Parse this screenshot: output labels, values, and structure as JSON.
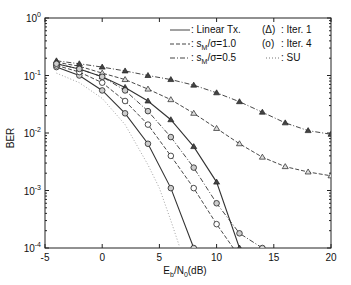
{
  "chart_data": {
    "type": "line",
    "title": "",
    "xlabel": "E_b/N_0(dB)",
    "ylabel": "BER",
    "xlim": [
      -5,
      20
    ],
    "ylim": [
      0.0001,
      1
    ],
    "yscale": "log",
    "xticks": [
      "-5",
      "0",
      "5",
      "10",
      "15",
      "20"
    ],
    "yticks": [
      "10^0",
      "10^-1",
      "10^-2",
      "10^-3",
      "10^-4"
    ],
    "grid": false,
    "legend": {
      "placement": "top-right",
      "left": [
        {
          "line": "solid",
          "label": ": Linear Tx."
        },
        {
          "line": "dashed",
          "label": ": s_M/σ=1.0"
        },
        {
          "line": "dashdot",
          "label": ": s_M/σ=0.5"
        }
      ],
      "right": [
        {
          "marker": "(Δ)",
          "label": ": Iter. 1"
        },
        {
          "marker": "(o)",
          "label": ": Iter. 4"
        },
        {
          "line": "dotted",
          "label": ": SU"
        }
      ]
    },
    "series": [
      {
        "name": "Linear Tx. Iter. 1",
        "line": "solid",
        "marker": "triangle",
        "x": [
          -4,
          -2,
          0,
          2,
          4,
          6,
          8,
          10,
          12
        ],
        "y": [
          0.16,
          0.13,
          0.095,
          0.062,
          0.036,
          0.017,
          0.0058,
          0.0014,
          0.0001
        ]
      },
      {
        "name": "Linear Tx. Iter. 4",
        "line": "solid",
        "marker": "circle",
        "x": [
          -4,
          -2,
          0,
          2,
          4,
          6,
          8
        ],
        "y": [
          0.14,
          0.1,
          0.055,
          0.022,
          0.0065,
          0.0011,
          0.0001
        ]
      },
      {
        "name": "s_M/σ=1.0 Iter. 1",
        "line": "dashed",
        "marker": "triangle",
        "x": [
          -4,
          -2,
          0,
          2,
          4,
          6,
          8,
          10,
          12,
          14,
          16,
          18,
          20
        ],
        "y": [
          0.17,
          0.145,
          0.11,
          0.085,
          0.058,
          0.038,
          0.022,
          0.012,
          0.0065,
          0.0038,
          0.0026,
          0.0021,
          0.0018
        ]
      },
      {
        "name": "s_M/σ=1.0 Iter. 4",
        "line": "dashed",
        "marker": "circle",
        "x": [
          -4,
          -2,
          0,
          2,
          4,
          6,
          8,
          10,
          12
        ],
        "y": [
          0.15,
          0.115,
          0.075,
          0.036,
          0.014,
          0.004,
          0.0011,
          0.00026,
          6e-05
        ]
      },
      {
        "name": "s_M/σ=0.5 Iter. 1",
        "line": "dashdot",
        "marker": "triangle",
        "x": [
          -4,
          -2,
          0,
          2,
          4,
          6,
          8,
          10,
          12,
          14,
          16,
          18,
          20
        ],
        "y": [
          0.18,
          0.16,
          0.14,
          0.12,
          0.1,
          0.085,
          0.068,
          0.05,
          0.035,
          0.023,
          0.015,
          0.011,
          0.0095
        ]
      },
      {
        "name": "s_M/σ=0.5 Iter. 4",
        "line": "dashdot",
        "marker": "circle",
        "x": [
          -4,
          -2,
          0,
          2,
          4,
          6,
          8,
          10,
          12,
          14
        ],
        "y": [
          0.16,
          0.13,
          0.095,
          0.055,
          0.024,
          0.0085,
          0.0025,
          0.0006,
          0.00018,
          0.0001
        ]
      },
      {
        "name": "SU",
        "line": "dotted",
        "marker": "none",
        "x": [
          -4,
          -2,
          0,
          2,
          4,
          5,
          6,
          6.8
        ],
        "y": [
          0.11,
          0.075,
          0.04,
          0.014,
          0.0028,
          0.0011,
          0.0003,
          0.0001
        ]
      }
    ]
  }
}
